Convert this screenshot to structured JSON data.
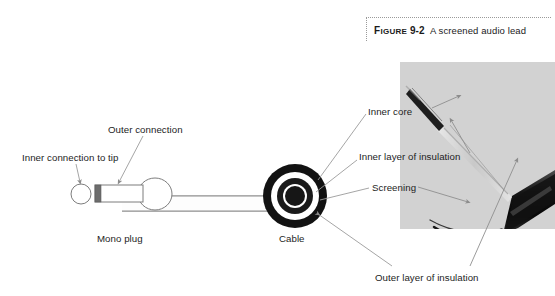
{
  "figure": {
    "caption_label": "FIGURE",
    "caption_number": "9-2",
    "caption_title": "A screened audio lead"
  },
  "diagram": {
    "labels": {
      "inner_connection": "Inner connection to tip",
      "outer_connection": "Outer connection",
      "mono_plug": "Mono plug",
      "cable": "Cable",
      "inner_core": "Inner core",
      "inner_layer_of_insulation": "Inner layer of insulation",
      "screening": "Screening",
      "outer_layer_of_insulation": "Outer layer of insulation"
    },
    "cross_section": {
      "name": "cable-cross-section",
      "rings": [
        {
          "name": "outer-layer-of-insulation",
          "color": "#111111"
        },
        {
          "name": "screening",
          "color": "#ffffff"
        },
        {
          "name": "inner-layer-of-insulation",
          "color": "#1a1a1a"
        },
        {
          "name": "inner-insulation-gap",
          "color": "#ffffff"
        },
        {
          "name": "inner-core",
          "color": "#161616"
        }
      ]
    },
    "plug": {
      "name": "mono-plug",
      "parts": [
        "tip",
        "insulating-ring",
        "shaft",
        "body"
      ]
    }
  },
  "photo": {
    "name": "screened-audio-lead-photo",
    "alt": "Photograph of a stripped screened audio lead showing inner core, inner insulation, screening braid and outer insulation"
  },
  "colors": {
    "ink": "#1d1d1d",
    "leader": "#9b9b9b",
    "outline": "#7d7d7d",
    "photo_bg": "#dcdcdc",
    "black": "#111111"
  }
}
